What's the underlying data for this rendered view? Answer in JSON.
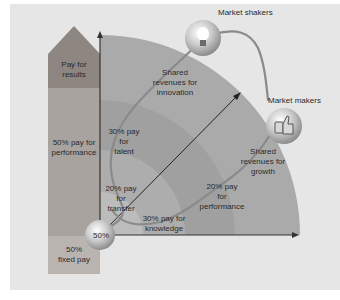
{
  "colors": {
    "panel_bg": "#e6e6e6",
    "column_top": "#8e8681",
    "column_mid": "#a8a39f",
    "column_bottom": "#b9b4b0",
    "band_outer": "#a9a9a9",
    "band_3": "#b4b4b4",
    "band_2": "#a2a2a2",
    "band_1": "#b8b8b8",
    "path_line": "#8a8a8a",
    "axis": "#333333"
  },
  "left_column": {
    "top_label": "Pay for\nresults",
    "middle_label": "50% pay for\nperformance",
    "bottom_label": "50%\nfixed pay"
  },
  "origin_ball": {
    "label": "50%"
  },
  "nodes": {
    "market_shakers": {
      "label": "Market shakers",
      "icon": "lightbulb-icon"
    },
    "market_makers": {
      "label": "Market makers",
      "icon": "thumbs-up-icon"
    }
  },
  "path_labels": {
    "transfer": "20% pay\nfor\ntransfer",
    "talent": "30% pay\nfor\ntalent",
    "innovation": "Shared\nrevenues for\ninnovation",
    "knowledge": "30% pay for\nknowledge",
    "performance": "20% pay\nfor\nperformance",
    "growth": "Shared\nrevenues for\ngrowth"
  }
}
